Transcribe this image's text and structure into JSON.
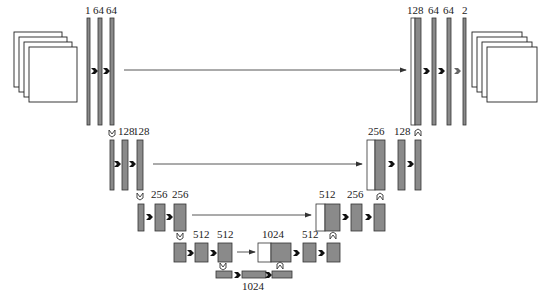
{
  "diagram": {
    "levels": [
      {
        "name": "level-1",
        "encoder_labels": [
          "1",
          "64",
          "64"
        ],
        "decoder_labels": [
          "128",
          "64",
          "64",
          "2"
        ]
      },
      {
        "name": "level-2",
        "encoder_labels": [
          "128",
          "128"
        ],
        "decoder_labels": [
          "256",
          "128"
        ]
      },
      {
        "name": "level-3",
        "encoder_labels": [
          "256",
          "256"
        ],
        "decoder_labels": [
          "512",
          "256"
        ]
      },
      {
        "name": "level-4",
        "encoder_labels": [
          "512",
          "512"
        ],
        "decoder_labels": [
          "1024",
          "512"
        ]
      },
      {
        "name": "bottleneck",
        "labels": [
          "1024"
        ]
      }
    ],
    "legend": {
      "conv_arrow": "conv 3x3, ReLU",
      "copy_arrow": "copy and crop",
      "down_arrow": "max pool 2x2",
      "up_arrow": "up-conv 2x2",
      "final_arrow": "conv 1x1"
    },
    "colors": {
      "feature_map": "#8a8a8a",
      "copied_map": "#ffffff",
      "stroke": "#333333"
    }
  }
}
